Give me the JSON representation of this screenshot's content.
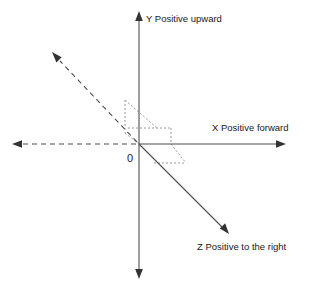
{
  "diagram": {
    "background_color": "#ffffff",
    "axis_color": "#4d4d4d",
    "guide_color": "#9a9a9a",
    "text_color": "#1a1a1a",
    "origin_label": "0",
    "labels": {
      "y_axis": "Y Positive upward",
      "x_axis": "X Positive forward",
      "z_axis": "Z Positive to the right"
    },
    "axes": [
      {
        "name": "y-axis",
        "label": "Y Positive upward",
        "direction": "vertical",
        "positive_end": "up",
        "style": "solid",
        "arrows": "both"
      },
      {
        "name": "x-axis",
        "label": "X Positive forward",
        "direction": "horizontal",
        "positive_end": "right",
        "style": "solid-right-dashed-left",
        "arrows": "both"
      },
      {
        "name": "z-axis",
        "label": "Z Positive to the right",
        "direction": "diagonal",
        "positive_end": "down-right",
        "style": "solid-positive-dashed-negative",
        "arrows": "both"
      }
    ],
    "origin": {
      "x": 139,
      "y": 144
    },
    "guides": [
      {
        "name": "upper-left-projection-box"
      },
      {
        "name": "upper-right-projection-box"
      },
      {
        "name": "lower-right-projection-box"
      }
    ]
  }
}
